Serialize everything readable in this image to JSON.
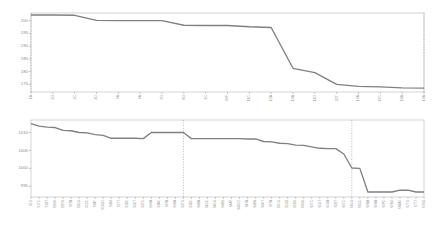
{
  "figure": {
    "background_color": "#ffffff",
    "line_color": "#808080",
    "frame_color": "#c2c2c2",
    "tick_label_color": "#8a8a8a",
    "vline_color": "#9a9a9a"
  },
  "chart_data": [
    {
      "type": "line",
      "title": "",
      "subtitle": "",
      "xlabel": "",
      "ylabel": "",
      "grid": false,
      "legend": "none",
      "ylim": [
        172,
        203
      ],
      "yticks": [
        175,
        180,
        185,
        190,
        195,
        200
      ],
      "ytick_labels": [
        "175",
        "180",
        "185",
        "190",
        "195",
        "200"
      ],
      "categories": [
        "1A",
        "2G",
        "3C",
        "4D",
        "5A",
        "6A",
        "7G",
        "8G",
        "9C",
        "10F",
        "11C",
        "12A",
        "13A",
        "14D",
        "15T",
        "16A",
        "17C",
        "18A",
        "19A"
      ],
      "values": [
        202.2,
        202.2,
        202.1,
        200.1,
        200.0,
        200.0,
        200.0,
        198.2,
        198.1,
        198.1,
        197.6,
        197.3,
        181.3,
        179.6,
        175.0,
        174.2,
        174.0,
        173.6,
        173.5
      ],
      "vlines": [
        "1A",
        "19A"
      ],
      "series": [
        {
          "name": "series-1",
          "values": [
            202.2,
            202.2,
            202.1,
            200.1,
            200.0,
            200.0,
            200.0,
            198.2,
            198.1,
            198.1,
            197.6,
            197.3,
            181.3,
            179.6,
            175.0,
            174.2,
            174.0,
            173.6,
            173.5
          ]
        }
      ]
    },
    {
      "type": "line",
      "title": "",
      "subtitle": "",
      "xlabel": "",
      "ylabel": "",
      "grid": false,
      "legend": "none",
      "ylim": [
        992,
        1013.5
      ],
      "yticks": [
        995,
        1000,
        1005,
        1010
      ],
      "ytick_labels": [
        "995",
        "1000",
        "1005",
        "1010"
      ],
      "categories": [
        "S1G",
        "S1TC",
        "S1BT",
        "S1NG",
        "S2RG",
        "S2TA",
        "S2GG",
        "S2CC",
        "S2A7",
        "S2GG2",
        "S2B4",
        "S2TT",
        "S2BC",
        "S3GT",
        "S3TC",
        "S3GA",
        "S3AC",
        "S3TA",
        "S3BA",
        "S3TG",
        "S3BC",
        "S4BA",
        "S4GC",
        "S4GG",
        "S4BG",
        "S4AT",
        "S4GC2",
        "S4TA",
        "S4BN",
        "S4GT",
        "S5TA",
        "S5CG",
        "S5GB",
        "S5BG",
        "S5NG",
        "S5TC",
        "S5GT",
        "S5GA",
        "S5BT",
        "S6TC",
        "S6GG",
        "S6GC",
        "S6NA",
        "S6BA",
        "S6PC",
        "S6BG",
        "S6BA2",
        "S7TG",
        "S7TT",
        "S7NG"
      ],
      "values": [
        1012.5,
        1011.8,
        1011.5,
        1011.4,
        1010.6,
        1010.5,
        1010.0,
        1009.9,
        1009.4,
        1009.2,
        1008.4,
        1008.4,
        1008.4,
        1008.4,
        1008.3,
        1010.0,
        1010.0,
        1010.0,
        1010.0,
        1010.0,
        1008.3,
        1008.3,
        1008.3,
        1008.3,
        1008.3,
        1008.3,
        1008.3,
        1008.2,
        1008.2,
        1007.5,
        1007.4,
        1007.0,
        1006.9,
        1006.5,
        1006.4,
        1006.0,
        1005.6,
        1005.5,
        1005.5,
        1004.0,
        1000.1,
        1000.0,
        993.4,
        993.4,
        993.4,
        993.4,
        993.9,
        993.9,
        993.4,
        993.4
      ],
      "vlines": [
        "S3TG",
        "S6GG"
      ],
      "series": [
        {
          "name": "series-1",
          "values": [
            1012.5,
            1011.8,
            1011.5,
            1011.4,
            1010.6,
            1010.5,
            1010.0,
            1009.9,
            1009.4,
            1009.2,
            1008.4,
            1008.4,
            1008.4,
            1008.4,
            1008.3,
            1010.0,
            1010.0,
            1010.0,
            1010.0,
            1010.0,
            1008.3,
            1008.3,
            1008.3,
            1008.3,
            1008.3,
            1008.3,
            1008.3,
            1008.2,
            1008.2,
            1007.5,
            1007.4,
            1007.0,
            1006.9,
            1006.5,
            1006.4,
            1006.0,
            1005.6,
            1005.5,
            1005.5,
            1004.0,
            1000.1,
            1000.0,
            993.4,
            993.4,
            993.4,
            993.4,
            993.9,
            993.9,
            993.4,
            993.4
          ]
        }
      ]
    }
  ]
}
